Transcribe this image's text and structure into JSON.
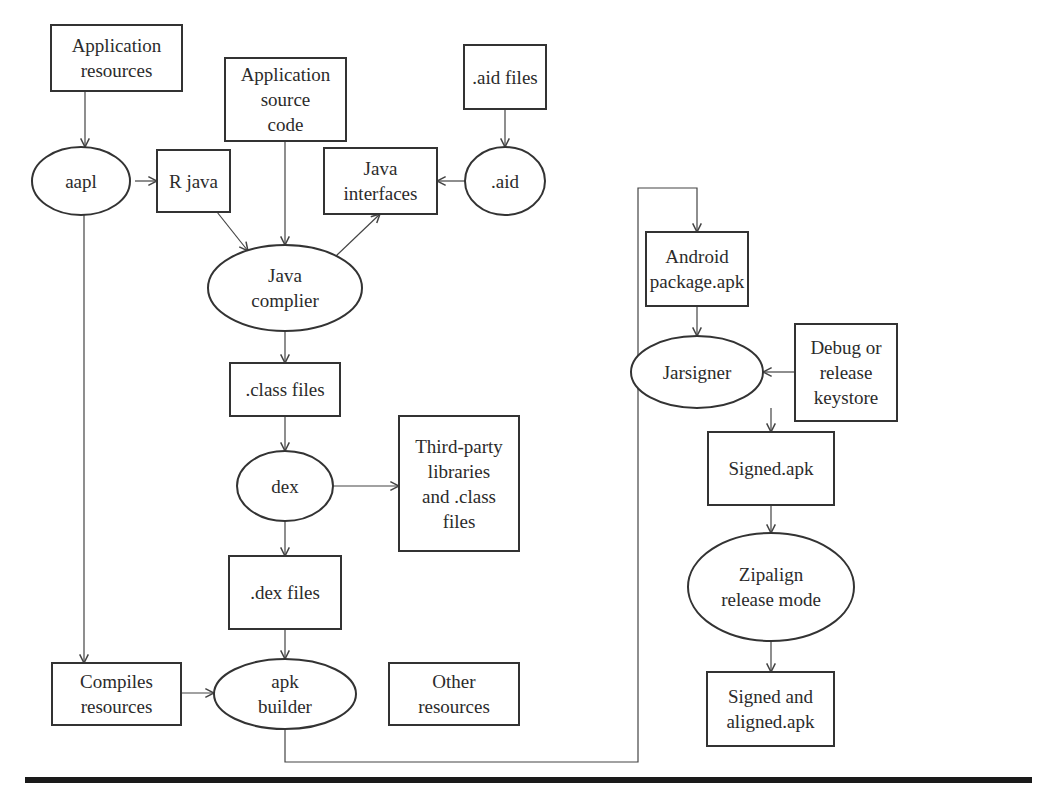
{
  "diagram": {
    "colors": {
      "stroke": "#333333",
      "text": "#2b2b2b",
      "background": "#ffffff",
      "rule": "#1a1a1a"
    },
    "nodes": [
      {
        "id": "app_resources",
        "shape": "rect",
        "lines": [
          "Application",
          "resources"
        ],
        "x": 51,
        "y": 25,
        "w": 131,
        "h": 66
      },
      {
        "id": "app_source",
        "shape": "rect",
        "lines": [
          "Application",
          "source",
          "code"
        ],
        "x": 225,
        "y": 58,
        "w": 121,
        "h": 83
      },
      {
        "id": "aid_files",
        "shape": "rect",
        "lines": [
          ".aid files"
        ],
        "x": 464,
        "y": 45,
        "w": 82,
        "h": 64
      },
      {
        "id": "aapl",
        "shape": "ellipse",
        "lines": [
          "aapl"
        ],
        "cx": 81,
        "cy": 181,
        "rx": 49,
        "ry": 34
      },
      {
        "id": "r_java",
        "shape": "rect",
        "lines": [
          "R java"
        ],
        "x": 157,
        "y": 150,
        "w": 73,
        "h": 62
      },
      {
        "id": "java_interfaces",
        "shape": "rect",
        "lines": [
          "Java",
          "interfaces"
        ],
        "x": 324,
        "y": 148,
        "w": 113,
        "h": 66
      },
      {
        "id": "aid",
        "shape": "ellipse",
        "lines": [
          ".aid"
        ],
        "cx": 505,
        "cy": 181,
        "rx": 40,
        "ry": 34
      },
      {
        "id": "java_compiler",
        "shape": "ellipse",
        "lines": [
          "Java",
          "complier"
        ],
        "cx": 285,
        "cy": 288,
        "rx": 77,
        "ry": 43
      },
      {
        "id": "class_files",
        "shape": "rect",
        "lines": [
          ".class files"
        ],
        "x": 230,
        "y": 363,
        "w": 110,
        "h": 53
      },
      {
        "id": "dex",
        "shape": "ellipse",
        "lines": [
          "dex"
        ],
        "cx": 285,
        "cy": 486,
        "rx": 48,
        "ry": 35
      },
      {
        "id": "third_party",
        "shape": "rect",
        "lines": [
          "Third-party",
          "libraries",
          "and .class",
          "files"
        ],
        "x": 399,
        "y": 416,
        "w": 120,
        "h": 135
      },
      {
        "id": "dex_files",
        "shape": "rect",
        "lines": [
          ".dex files"
        ],
        "x": 229,
        "y": 556,
        "w": 112,
        "h": 73
      },
      {
        "id": "compiles_resources",
        "shape": "rect",
        "lines": [
          "Compiles",
          "resources"
        ],
        "x": 52,
        "y": 663,
        "w": 129,
        "h": 62
      },
      {
        "id": "apk_builder",
        "shape": "ellipse",
        "lines": [
          "apk",
          "builder"
        ],
        "cx": 285,
        "cy": 694,
        "rx": 71,
        "ry": 35
      },
      {
        "id": "other_resources",
        "shape": "rect",
        "lines": [
          "Other",
          "resources"
        ],
        "x": 389,
        "y": 663,
        "w": 130,
        "h": 62
      },
      {
        "id": "android_package",
        "shape": "rect",
        "lines": [
          "Android",
          "package.apk"
        ],
        "x": 646,
        "y": 232,
        "w": 102,
        "h": 74
      },
      {
        "id": "jarsigner",
        "shape": "ellipse",
        "lines": [
          "Jarsigner"
        ],
        "cx": 697,
        "cy": 372,
        "rx": 66,
        "ry": 36
      },
      {
        "id": "keystore",
        "shape": "rect",
        "lines": [
          "Debug or",
          "release",
          "keystore"
        ],
        "x": 795,
        "y": 324,
        "w": 102,
        "h": 97
      },
      {
        "id": "signed_apk",
        "shape": "rect",
        "lines": [
          "Signed.apk"
        ],
        "x": 708,
        "y": 432,
        "w": 126,
        "h": 73
      },
      {
        "id": "zipalign",
        "shape": "ellipse",
        "lines": [
          "Zipalign",
          "release mode"
        ],
        "cx": 771,
        "cy": 587,
        "rx": 83,
        "ry": 54
      },
      {
        "id": "signed_aligned",
        "shape": "rect",
        "lines": [
          "Signed and",
          "aligned.apk"
        ],
        "x": 707,
        "y": 672,
        "w": 127,
        "h": 74
      }
    ],
    "edges": [
      {
        "from": "app_resources",
        "to": "aapl",
        "points": [
          [
            85,
            91
          ],
          [
            85,
            147
          ]
        ]
      },
      {
        "from": "aapl",
        "to": "r_java",
        "points": [
          [
            135,
            181
          ],
          [
            157,
            181
          ]
        ]
      },
      {
        "from": "aapl",
        "to": "compiles_resources",
        "points": [
          [
            84,
            215
          ],
          [
            84,
            663
          ]
        ]
      },
      {
        "from": "aid_files",
        "to": "aid",
        "points": [
          [
            505,
            109
          ],
          [
            505,
            147
          ]
        ]
      },
      {
        "from": "aid",
        "to": "java_interfaces",
        "points": [
          [
            465,
            181
          ],
          [
            437,
            181
          ]
        ]
      },
      {
        "from": "r_java",
        "to": "java_compiler",
        "points": [
          [
            217,
            212
          ],
          [
            248,
            251
          ]
        ]
      },
      {
        "from": "app_source",
        "to": "java_compiler",
        "points": [
          [
            285,
            141
          ],
          [
            285,
            245
          ]
        ]
      },
      {
        "from": "java_compiler",
        "to": "java_interfaces",
        "points": [
          [
            336,
            256
          ],
          [
            380,
            214
          ]
        ]
      },
      {
        "from": "java_compiler",
        "to": "class_files",
        "points": [
          [
            285,
            331
          ],
          [
            285,
            363
          ]
        ]
      },
      {
        "from": "class_files",
        "to": "dex",
        "points": [
          [
            285,
            416
          ],
          [
            285,
            451
          ]
        ]
      },
      {
        "from": "dex",
        "to": "third_party",
        "points": [
          [
            333,
            486
          ],
          [
            399,
            486
          ]
        ]
      },
      {
        "from": "dex",
        "to": "dex_files",
        "points": [
          [
            285,
            521
          ],
          [
            285,
            556
          ]
        ]
      },
      {
        "from": "dex_files",
        "to": "apk_builder",
        "points": [
          [
            285,
            629
          ],
          [
            285,
            659
          ]
        ]
      },
      {
        "from": "compiles_resources",
        "to": "apk_builder",
        "points": [
          [
            181,
            693
          ],
          [
            214,
            693
          ]
        ]
      },
      {
        "from": "apk_builder",
        "to": "android_package",
        "points": [
          [
            285,
            729
          ],
          [
            285,
            762
          ],
          [
            638,
            762
          ],
          [
            638,
            188
          ],
          [
            697,
            188
          ],
          [
            697,
            232
          ]
        ]
      },
      {
        "from": "android_package",
        "to": "jarsigner",
        "points": [
          [
            697,
            306
          ],
          [
            697,
            336
          ]
        ]
      },
      {
        "from": "keystore",
        "to": "jarsigner",
        "points": [
          [
            795,
            372
          ],
          [
            763,
            372
          ]
        ]
      },
      {
        "from": "jarsigner",
        "to": "signed_apk",
        "points": [
          [
            771,
            408
          ],
          [
            771,
            432
          ]
        ]
      },
      {
        "from": "signed_apk",
        "to": "zipalign",
        "points": [
          [
            771,
            505
          ],
          [
            771,
            533
          ]
        ]
      },
      {
        "from": "zipalign",
        "to": "signed_aligned",
        "points": [
          [
            771,
            641
          ],
          [
            771,
            672
          ]
        ]
      }
    ],
    "rule": {
      "x1": 25,
      "x2": 1032,
      "y": 780,
      "thickness": 6
    }
  }
}
